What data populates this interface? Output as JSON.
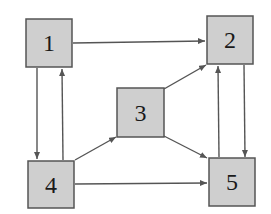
{
  "diagram": {
    "type": "directed-graph",
    "colors": {
      "node_fill": "#cfcfcf",
      "node_stroke": "#555555",
      "edge": "#555555",
      "label": "#1a1a1a",
      "background": "#ffffff"
    },
    "nodes": [
      {
        "id": "1",
        "label": "1"
      },
      {
        "id": "2",
        "label": "2"
      },
      {
        "id": "3",
        "label": "3"
      },
      {
        "id": "4",
        "label": "4"
      },
      {
        "id": "5",
        "label": "5"
      }
    ],
    "edges": [
      {
        "from": "1",
        "to": "2"
      },
      {
        "from": "1",
        "to": "4"
      },
      {
        "from": "4",
        "to": "1"
      },
      {
        "from": "4",
        "to": "3"
      },
      {
        "from": "4",
        "to": "5"
      },
      {
        "from": "3",
        "to": "2"
      },
      {
        "from": "3",
        "to": "5"
      },
      {
        "from": "5",
        "to": "2"
      },
      {
        "from": "2",
        "to": "5"
      }
    ]
  }
}
